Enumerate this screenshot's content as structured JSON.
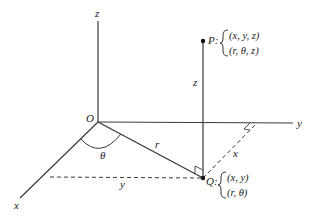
{
  "diagram": {
    "type": "cylindrical-coordinates-3d",
    "colors": {
      "line": "#3a3a3a",
      "text": "#222222",
      "background": "#ffffff"
    },
    "axes": {
      "z_label": "z",
      "y_label": "y",
      "x_label": "x",
      "origin_label": "O"
    },
    "point_p": {
      "name": "P:",
      "coords_cartesian": "(x, y, z)",
      "coords_cylindrical": "(r, θ, z)"
    },
    "point_q": {
      "name": "Q:",
      "coords_cartesian": "(x, y)",
      "coords_cylindrical": "(r, θ)"
    },
    "segment_labels": {
      "r": "r",
      "theta": "θ",
      "z_height": "z",
      "x_dist": "x",
      "y_dist": "y"
    }
  }
}
